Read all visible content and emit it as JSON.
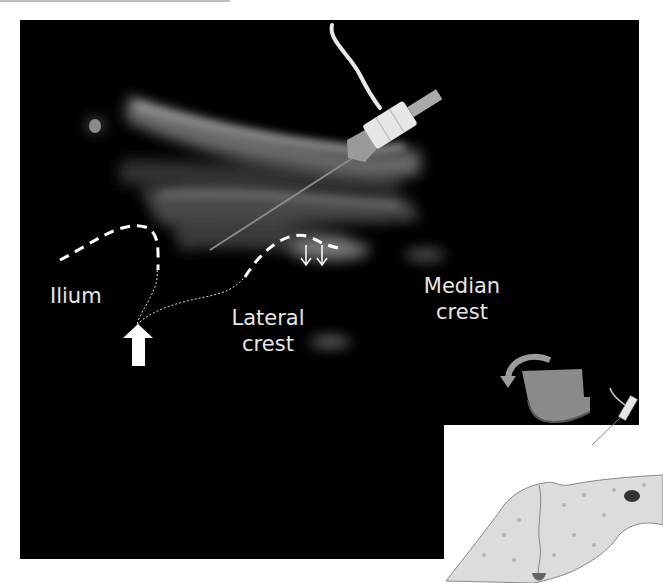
{
  "figure": {
    "type": "ultrasound-image-with-schematic-inset",
    "labels": {
      "ilium": "Ilium",
      "lateral_crest_line1": "Lateral",
      "lateral_crest_line2": "crest",
      "median_crest_line1": "Median",
      "median_crest_line2": "crest"
    },
    "annotations": {
      "dashed_bone_outline": "white dashed line tracing ilium and lateral crest surfaces",
      "dotted_line": "needle path/joint line from ilium to lateral crest",
      "thick_arrow": "white block arrow pointing up at joint",
      "double_arrows": "two thin white downward arrows over lateral crest",
      "needle": "needle with hub and syringe entering from upper right"
    },
    "inset": {
      "description": "schematic of ultrasound probe with rotation arrow above bone cross-section, needle in-plane"
    },
    "colors": {
      "background": "#000000",
      "page": "#ffffff",
      "label_text": "#e6e6e6",
      "probe": "#8a8a8a",
      "bone": "#d9d9d9"
    }
  }
}
